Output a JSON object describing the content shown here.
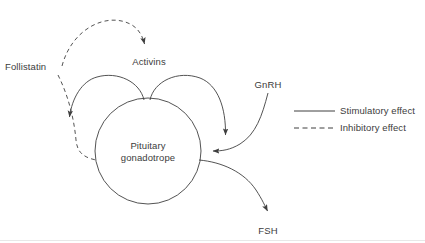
{
  "figure": {
    "line_color": "#3f3f3f",
    "text_color": "#3c3c3c",
    "background": "#ffffff"
  },
  "nodes": {
    "follistatin": {
      "label": "Follistatin",
      "x": 31,
      "y": 67
    },
    "activins": {
      "label": "Activins",
      "x": 149,
      "y": 62
    },
    "gnrh": {
      "label": "GnRH",
      "x": 268,
      "y": 85
    },
    "fsh": {
      "label": "FSH",
      "x": 268,
      "y": 231
    },
    "gonadotrope": {
      "line1": "Pituitary",
      "line2": "gonadotrope",
      "cx": 148,
      "cy": 151,
      "r": 53
    }
  },
  "arrows": [
    {
      "name": "follistatin-inhibits-activins",
      "from": "Follistatin",
      "to": "Activins",
      "style": "dashed",
      "effect": "Inhibitory effect"
    },
    {
      "name": "follistatin-inhibits-gonadotrope",
      "from": "Follistatin",
      "to": "Pituitary gonadotrope",
      "style": "dashed",
      "effect": "Inhibitory effect"
    },
    {
      "name": "activins-stimulate-gonadotrope-left",
      "from": "Activins",
      "to": "Pituitary gonadotrope",
      "style": "solid",
      "effect": "Stimulatory effect"
    },
    {
      "name": "activins-stimulate-gonadotrope-right",
      "from": "Activins",
      "to": "Pituitary gonadotrope",
      "style": "solid",
      "effect": "Stimulatory effect"
    },
    {
      "name": "gnrh-stimulates-gonadotrope",
      "from": "GnRH",
      "to": "Pituitary gonadotrope",
      "style": "solid",
      "effect": "Stimulatory effect"
    },
    {
      "name": "gonadotrope-secretes-fsh",
      "from": "Pituitary gonadotrope",
      "to": "FSH",
      "style": "solid",
      "effect": "Stimulatory effect"
    }
  ],
  "legend": {
    "items": [
      {
        "style": "solid",
        "label": "Stimulatory effect"
      },
      {
        "style": "dashed",
        "label": "Inhibitory effect"
      }
    ]
  }
}
